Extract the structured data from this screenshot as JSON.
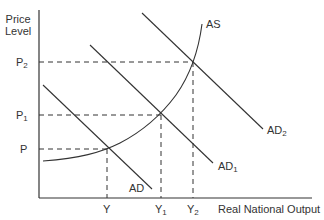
{
  "diagram": {
    "type": "aggregate-demand-aggregate-supply",
    "y_axis_label_line1": "Price",
    "y_axis_label_line2": "Level",
    "x_axis_label": "Real National Output",
    "price_levels": [
      {
        "base": "P",
        "sub": ""
      },
      {
        "base": "P",
        "sub": "1"
      },
      {
        "base": "P",
        "sub": "2"
      }
    ],
    "output_levels": [
      {
        "base": "Y",
        "sub": ""
      },
      {
        "base": "Y",
        "sub": "1"
      },
      {
        "base": "Y",
        "sub": "2"
      }
    ],
    "curves": {
      "as": {
        "base": "AS",
        "sub": ""
      },
      "ad": {
        "base": "AD",
        "sub": ""
      },
      "ad1": {
        "base": "AD",
        "sub": "1"
      },
      "ad2": {
        "base": "AD",
        "sub": "2"
      }
    },
    "equilibria": [
      {
        "price": "P",
        "output": "Y",
        "curve": "AD"
      },
      {
        "price": "P1",
        "output": "Y1",
        "curve": "AD1"
      },
      {
        "price": "P2",
        "output": "Y2",
        "curve": "AD2"
      }
    ],
    "colors": {
      "line": "#333333",
      "text": "#333333"
    }
  }
}
